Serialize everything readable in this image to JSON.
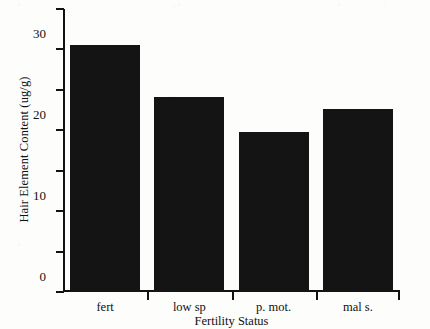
{
  "chart_data": {
    "type": "bar",
    "title": "",
    "subtitle": "",
    "xlabel": "Fertility Status",
    "ylabel": "Hair Element Content (ug/g)",
    "categories": [
      "fert",
      "low sp",
      "p. mot.",
      "mal s."
    ],
    "values": [
      61.2,
      48.2,
      39.5,
      45.3
    ],
    "series": [
      {
        "name": "Hair Element Content",
        "values": [
          61.2,
          48.2,
          39.5,
          45.3
        ]
      }
    ],
    "ylim": [
      0,
      70
    ],
    "yticks": [
      0,
      10,
      20,
      30,
      40,
      50,
      60,
      70
    ],
    "ytick_labels": [
      "0",
      "10",
      "20",
      "30",
      "40",
      "50",
      "60",
      "70"
    ],
    "grid": false,
    "legend": false,
    "legend_position": "none",
    "bar_color": "#141414",
    "axis_color": "#121212",
    "background_color": "#fdfdfb"
  },
  "figure": {
    "ylabel": "Hair Element Content (ug/g)",
    "xlabel": "Fertility Status"
  }
}
